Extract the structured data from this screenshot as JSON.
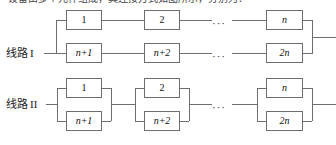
{
  "figure": {
    "caption_cut": "设备由多个元件组成，其连接方式如图所示，分别为：",
    "width": 336,
    "height": 145,
    "line_color": "#6e6e6e",
    "text_color": "#111111",
    "background": "#ffffff"
  },
  "rows": [
    {
      "id": "line-1",
      "label_text": "线路",
      "label_numeral": "I",
      "topology": "two series chains in parallel",
      "top_chain": [
        {
          "label": "1"
        },
        {
          "label": "2"
        },
        {
          "label": "n",
          "italic": true
        }
      ],
      "bottom_chain": [
        {
          "label": "n+1",
          "italic": true
        },
        {
          "label": "n+2",
          "italic": true
        },
        {
          "label": "2n",
          "italic": true
        }
      ],
      "ellipsis": "···"
    },
    {
      "id": "line-2",
      "label_text": "线路",
      "label_numeral": "II",
      "topology": "n parallel pairs in series",
      "pairs": [
        {
          "top": "1",
          "bottom": "n+1"
        },
        {
          "top": "2",
          "bottom": "n+2"
        },
        {
          "top": "n",
          "bottom": "2n"
        }
      ],
      "ellipsis": "···"
    }
  ]
}
